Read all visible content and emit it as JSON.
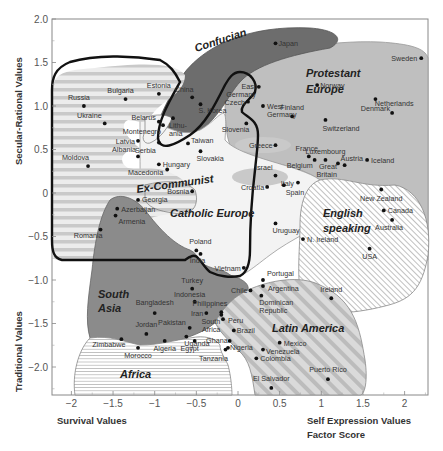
{
  "chart_data": {
    "type": "scatter",
    "title": "",
    "xlabel": "Survival Values / Self Expression Values Factor Score",
    "ylabel": "Traditional Values / Secular-Rational Values",
    "xlim": [
      -2.3,
      2.28
    ],
    "ylim": [
      -2.3,
      2.0
    ],
    "grid": false,
    "x_ticks": [
      "-2",
      "-1.5",
      "-1",
      "-0.5",
      "0",
      "0.5",
      "1",
      "1.5",
      "2"
    ],
    "y_ticks": [
      "2.0",
      "1.5",
      "1.0",
      "0.5",
      "0",
      "-0.5",
      "-1.0",
      "-1.5",
      "-2.0"
    ],
    "axis_labels": {
      "x_left": "Survival Values",
      "x_right_line1": "Self Expression Values",
      "x_right_line2": "Factor Score",
      "y_top": "Secular-Rational Values",
      "y_bottom": "Traditional Values"
    },
    "regions": [
      {
        "name": "Confucian",
        "fill": "#6e6e6e"
      },
      {
        "name": "Protestant Europe",
        "fill": "#bdbdbd"
      },
      {
        "name": "Ex-Communist",
        "fill": "#e2e2e2",
        "pattern": "horizontal-stripes"
      },
      {
        "name": "Catholic Europe",
        "fill": "#f4f4f4"
      },
      {
        "name": "English speaking",
        "fill": "#ffffff",
        "pattern": "diagonal-hatch"
      },
      {
        "name": "South Asia",
        "fill": "#8a8a8a"
      },
      {
        "name": "Latin America",
        "fill": "#d6d6d6",
        "pattern": "wide-diagonal-stripes"
      },
      {
        "name": "Africa",
        "fill": "#ffffff",
        "pattern": "horizontal-lines"
      }
    ],
    "points": [
      {
        "name": "Japan",
        "x": 0.45,
        "y": 1.72,
        "lx": -1,
        "dx": 3,
        "dy": 3
      },
      {
        "name": "Sweden",
        "x": 2.2,
        "y": 1.55,
        "anchor": "end",
        "dx": -4,
        "dy": 3
      },
      {
        "name": "Estonia",
        "x": -0.95,
        "y": 1.14,
        "anchor": "middle",
        "dx": 0,
        "dy": -6
      },
      {
        "name": "Bulgaria",
        "x": -1.35,
        "y": 1.08,
        "anchor": "middle",
        "dx": -5,
        "dy": -6
      },
      {
        "name": "Russia",
        "x": -1.85,
        "y": 1.0,
        "anchor": "middle",
        "dx": -5,
        "dy": -6
      },
      {
        "name": "China",
        "x": -0.55,
        "y": 1.1,
        "anchor": "middle",
        "dx": -8,
        "dy": -5
      },
      {
        "name": "S. Korea",
        "x": -0.45,
        "y": 1.02,
        "anchor": "start",
        "dx": -2,
        "dy": 9
      },
      {
        "name": "East Germany",
        "multiline": [
          "East",
          "Germany"
        ],
        "x": 0.25,
        "y": 1.22,
        "anchor": "end",
        "dx": -3,
        "dy": 2
      },
      {
        "name": "Norway",
        "x": 0.95,
        "y": 1.24,
        "anchor": "start",
        "dx": 3,
        "dy": 3
      },
      {
        "name": "Czech",
        "x": 0.12,
        "y": 1.05,
        "anchor": "end",
        "dx": -3,
        "dy": 3
      },
      {
        "name": "West Germany",
        "multiline": [
          "West",
          "Germany"
        ],
        "x": 0.3,
        "y": 1.0,
        "anchor": "start",
        "dx": 4,
        "dy": 3
      },
      {
        "name": "Denmark",
        "x": 1.65,
        "y": 1.08,
        "anchor": "middle",
        "dx": 0,
        "dy": 12
      },
      {
        "name": "Belarus",
        "x": -0.95,
        "y": 0.82,
        "anchor": "end",
        "dx": -3,
        "dy": -2
      },
      {
        "name": "Ukraine",
        "x": -1.6,
        "y": 0.8,
        "anchor": "end",
        "dx": -3,
        "dy": -5
      },
      {
        "name": "Lithuania",
        "multiline": [
          "Lithu-",
          "ania"
        ],
        "x": -0.78,
        "y": 0.86,
        "anchor": "start",
        "dx": -4,
        "dy": 10
      },
      {
        "name": "Montenegro",
        "x": -0.9,
        "y": 0.78,
        "anchor": "end",
        "dx": -2,
        "dy": 9
      },
      {
        "name": "Netherlands",
        "x": 1.85,
        "y": 0.92,
        "anchor": "middle",
        "dx": 2,
        "dy": -7
      },
      {
        "name": "Finland",
        "x": 0.65,
        "y": 0.88,
        "anchor": "middle",
        "dx": 0,
        "dy": -6
      },
      {
        "name": "Slovenia",
        "x": 0.1,
        "y": 0.8,
        "anchor": "end",
        "dx": 3,
        "dy": 9
      },
      {
        "name": "Switzerland",
        "x": 1.05,
        "y": 0.84,
        "anchor": "start",
        "dx": -3,
        "dy": 11
      },
      {
        "name": "Latvia",
        "x": -1.2,
        "y": 0.6,
        "anchor": "end",
        "dx": -3,
        "dy": 3
      },
      {
        "name": "Serbia",
        "x": -0.95,
        "y": 0.58,
        "anchor": "end",
        "dx": -3,
        "dy": 10
      },
      {
        "name": "Taiwan",
        "x": -0.6,
        "y": 0.57,
        "anchor": "start",
        "dx": 3,
        "dy": 0
      },
      {
        "name": "Albania",
        "x": -1.2,
        "y": 0.42,
        "anchor": "end",
        "dx": -2,
        "dy": -4
      },
      {
        "name": "Slovakia",
        "x": -0.45,
        "y": 0.48,
        "anchor": "start",
        "dx": -4,
        "dy": 10
      },
      {
        "name": "Greece",
        "x": 0.45,
        "y": 0.55,
        "anchor": "end",
        "dx": -3,
        "dy": 3
      },
      {
        "name": "Moldova",
        "x": -1.8,
        "y": 0.31,
        "anchor": "end",
        "dx": 1,
        "dy": -6
      },
      {
        "name": "Hungary",
        "x": -0.95,
        "y": 0.33,
        "anchor": "start",
        "dx": 4,
        "dy": 3
      },
      {
        "name": "France",
        "x": 0.85,
        "y": 0.42,
        "anchor": "middle",
        "dx": -2,
        "dy": -5
      },
      {
        "name": "Luxembourg",
        "x": 1.05,
        "y": 0.38,
        "anchor": "middle",
        "dx": 0,
        "dy": -6
      },
      {
        "name": "Belgium",
        "x": 0.92,
        "y": 0.38,
        "anchor": "end",
        "dx": -2,
        "dy": 8
      },
      {
        "name": "Iceland",
        "x": 1.55,
        "y": 0.38,
        "anchor": "start",
        "dx": 4,
        "dy": 3
      },
      {
        "name": "Macedonia",
        "x": -0.85,
        "y": 0.27,
        "anchor": "end",
        "dx": -4,
        "dy": 5
      },
      {
        "name": "Israel",
        "x": 0.45,
        "y": 0.2,
        "anchor": "end",
        "dx": -3,
        "dy": -6
      },
      {
        "name": "Austria",
        "x": 1.28,
        "y": 0.32,
        "anchor": "start",
        "dx": -4,
        "dy": -4
      },
      {
        "name": "Great Britain",
        "multiline": [
          "Great",
          "Britain"
        ],
        "x": 1.2,
        "y": 0.34,
        "anchor": "end",
        "dx": -1,
        "dy": 6
      },
      {
        "name": "Italy",
        "x": 0.72,
        "y": 0.12,
        "anchor": "end",
        "dx": -4,
        "dy": 3
      },
      {
        "name": "Bosnia",
        "x": -0.55,
        "y": 0.02,
        "anchor": "end",
        "dx": -3,
        "dy": 3
      },
      {
        "name": "Croatia",
        "x": 0.35,
        "y": 0.07,
        "anchor": "end",
        "dx": -3,
        "dy": 3
      },
      {
        "name": "Spain",
        "x": 0.55,
        "y": 0.09,
        "anchor": "start",
        "dx": 2,
        "dy": 10
      },
      {
        "name": "New Zealand",
        "x": 1.72,
        "y": 0.04,
        "anchor": "middle",
        "dx": 0,
        "dy": 11
      },
      {
        "name": "Georgia",
        "x": -1.2,
        "y": -0.08,
        "anchor": "start",
        "dx": 4,
        "dy": 2
      },
      {
        "name": "Canada",
        "x": 1.75,
        "y": -0.2,
        "anchor": "start",
        "dx": 4,
        "dy": 3
      },
      {
        "name": "Azerbaijan",
        "x": -1.45,
        "y": -0.18,
        "anchor": "start",
        "dx": 4,
        "dy": 3
      },
      {
        "name": "Australia",
        "x": 1.85,
        "y": -0.31,
        "anchor": "middle",
        "dx": -3,
        "dy": 10
      },
      {
        "name": "Armenia",
        "x": -1.47,
        "y": -0.26,
        "anchor": "start",
        "dx": 3,
        "dy": 8
      },
      {
        "name": "Uruguay",
        "x": 0.45,
        "y": -0.35,
        "anchor": "start",
        "dx": -3,
        "dy": 10
      },
      {
        "name": "Romania",
        "x": -1.65,
        "y": -0.42,
        "anchor": "end",
        "dx": 2,
        "dy": 8
      },
      {
        "name": "N. Ireland",
        "x": 0.78,
        "y": -0.53,
        "anchor": "start",
        "dx": 4,
        "dy": 3
      },
      {
        "name": "USA",
        "x": 1.58,
        "y": -0.64,
        "anchor": "middle",
        "dx": 0,
        "dy": 10
      },
      {
        "name": "Poland",
        "x": -0.5,
        "y": -0.66,
        "anchor": "middle",
        "dx": 4,
        "dy": -6
      },
      {
        "name": "India",
        "x": -0.45,
        "y": -0.7,
        "anchor": "middle",
        "dx": -3,
        "dy": 9
      },
      {
        "name": "Vietnam",
        "x": 0.07,
        "y": -0.86,
        "anchor": "end",
        "dx": -3,
        "dy": 3
      },
      {
        "name": "Turkey",
        "x": -0.55,
        "y": -1.1,
        "anchor": "middle",
        "dx": 0,
        "dy": -6
      },
      {
        "name": "Indonesia",
        "x": -0.52,
        "y": -1.25,
        "anchor": "middle",
        "dx": -5,
        "dy": -5
      },
      {
        "name": "Portugal",
        "x": 0.3,
        "y": -1.0,
        "anchor": "start",
        "dx": 4,
        "dy": -4
      },
      {
        "name": "Chile",
        "x": 0.15,
        "y": -1.12,
        "anchor": "end",
        "dx": -3,
        "dy": 3
      },
      {
        "name": "Argentina",
        "x": 0.3,
        "y": -1.07,
        "anchor": "start",
        "dx": 5,
        "dy": 5
      },
      {
        "name": "Dominican Republic",
        "multiline": [
          "Dominican",
          "Republic"
        ],
        "x": 0.28,
        "y": -1.18,
        "anchor": "start",
        "dx": -2,
        "dy": 9
      },
      {
        "name": "Bangladesh",
        "x": -1.0,
        "y": -1.38,
        "anchor": "middle",
        "dx": 0,
        "dy": -8
      },
      {
        "name": "Philippines",
        "x": -0.2,
        "y": -1.37,
        "anchor": "end",
        "dx": 6,
        "dy": -6
      },
      {
        "name": "Iran",
        "x": -0.38,
        "y": -1.38,
        "anchor": "end",
        "dx": -3,
        "dy": 3
      },
      {
        "name": "South Africa",
        "multiline": [
          "South",
          "Africa"
        ],
        "x": -0.2,
        "y": -1.4,
        "anchor": "end",
        "dx": -1,
        "dy": 9
      },
      {
        "name": "Peru",
        "x": -0.18,
        "y": -1.45,
        "anchor": "start",
        "dx": 5,
        "dy": 4
      },
      {
        "name": "Brazil",
        "x": -0.05,
        "y": -1.58,
        "anchor": "start",
        "dx": 3,
        "dy": 3
      },
      {
        "name": "Pakistan",
        "x": -0.58,
        "y": -1.55,
        "anchor": "end",
        "dx": -4,
        "dy": -3
      },
      {
        "name": "Jordan",
        "x": -1.1,
        "y": -1.62,
        "anchor": "middle",
        "dx": 0,
        "dy": -7
      },
      {
        "name": "Uganda",
        "x": -0.62,
        "y": -1.65,
        "anchor": "start",
        "dx": -2,
        "dy": 9
      },
      {
        "name": "Zimbabwe",
        "x": -1.4,
        "y": -1.68,
        "anchor": "end",
        "dx": 4,
        "dy": 8
      },
      {
        "name": "Algeria",
        "x": -0.88,
        "y": -1.7,
        "anchor": "middle",
        "dx": 0,
        "dy": 10
      },
      {
        "name": "Egypt",
        "x": -0.52,
        "y": -1.7,
        "anchor": "middle",
        "dx": -5,
        "dy": 10
      },
      {
        "name": "Ghana",
        "x": -0.1,
        "y": -1.7,
        "anchor": "end",
        "dx": -2,
        "dy": 2
      },
      {
        "name": "Mexico",
        "x": 0.5,
        "y": -1.72,
        "anchor": "start",
        "dx": 4,
        "dy": 3
      },
      {
        "name": "Nigeria",
        "x": -0.12,
        "y": -1.78,
        "anchor": "start",
        "dx": 2,
        "dy": 2
      },
      {
        "name": "Venezuela",
        "x": 0.3,
        "y": -1.8,
        "anchor": "start",
        "dx": 3,
        "dy": 4
      },
      {
        "name": "Morocco",
        "x": -1.2,
        "y": -1.78,
        "anchor": "middle",
        "dx": 0,
        "dy": 10
      },
      {
        "name": "Tanzania",
        "x": -0.15,
        "y": -1.8,
        "anchor": "middle",
        "dx": -12,
        "dy": 11
      },
      {
        "name": "Colombia",
        "x": 0.22,
        "y": -1.9,
        "anchor": "start",
        "dx": 4,
        "dy": 3
      },
      {
        "name": "Puerto Rico",
        "x": 1.08,
        "y": -2.14,
        "anchor": "middle",
        "dx": 0,
        "dy": -7
      },
      {
        "name": "El Salvador",
        "x": 0.4,
        "y": -2.24,
        "anchor": "middle",
        "dx": 0,
        "dy": -7
      },
      {
        "name": "Ireland",
        "x": 1.12,
        "y": -1.21,
        "anchor": "middle",
        "dx": 0,
        "dy": -6
      }
    ]
  }
}
